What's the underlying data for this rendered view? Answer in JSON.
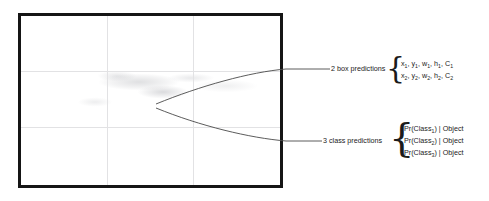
{
  "figure": {
    "image_panel": {
      "name": "input-image-with-grid",
      "grid_columns": 3,
      "grid_rows": 3,
      "border_color": "#151515",
      "grid_color": "#e2e2e4"
    },
    "annotations": [
      {
        "id": "box-predictions",
        "label": "2 box predictions",
        "rows": [
          {
            "parts": [
              {
                "t": "x",
                "sub": "1"
              },
              {
                "t": ", "
              },
              {
                "t": "y",
                "sub": "1"
              },
              {
                "t": ", "
              },
              {
                "t": "w",
                "sub": "1"
              },
              {
                "t": ", "
              },
              {
                "t": "h",
                "sub": "1"
              },
              {
                "t": ", "
              },
              {
                "t": "C",
                "sub": "1"
              }
            ],
            "plain": "x1, y1, w1, h1, C1"
          },
          {
            "parts": [
              {
                "t": "x",
                "sub": "2"
              },
              {
                "t": ", "
              },
              {
                "t": "y",
                "sub": "2"
              },
              {
                "t": ", "
              },
              {
                "t": "w",
                "sub": "2"
              },
              {
                "t": ", "
              },
              {
                "t": "h",
                "sub": "2"
              },
              {
                "t": ", "
              },
              {
                "t": "C",
                "sub": "2"
              }
            ],
            "plain": "x2, y2, w2, h2, C2"
          }
        ],
        "brace": "{"
      },
      {
        "id": "class-predictions",
        "label": "3 class predictions",
        "rows": [
          {
            "parts": [
              {
                "t": "Pr(Class"
              },
              {
                "t": "1",
                "sub": true
              },
              {
                "t": ") | Object"
              }
            ],
            "plain": "Pr(Class1) | Object"
          },
          {
            "parts": [
              {
                "t": "Pr(Class"
              },
              {
                "t": "2",
                "sub": true
              },
              {
                "t": ") | Object"
              }
            ],
            "plain": "Pr(Class2) | Object"
          },
          {
            "parts": [
              {
                "t": "Pr(Class"
              },
              {
                "t": "3",
                "sub": true
              },
              {
                "t": ") | Object"
              }
            ],
            "plain": "Pr(Class3) | Object"
          }
        ],
        "brace": "{"
      }
    ],
    "box_predictions": {
      "label": "2 box predictions",
      "brace": "{",
      "line1": {
        "pre": "x",
        "s1": "1",
        "a": ", y",
        "s2": "1",
        "b": ", w",
        "s3": "1",
        "c": ", h",
        "s4": "1",
        "d": ", C",
        "s5": "1"
      },
      "line2": {
        "pre": "x",
        "s1": "2",
        "a": ", y",
        "s2": "2",
        "b": ", w",
        "s3": "2",
        "c": ", h",
        "s4": "2",
        "d": ", C",
        "s5": "2"
      }
    },
    "class_predictions": {
      "label": "3 class predictions",
      "brace": "{",
      "line1_pre": "Pr(Class",
      "line1_sub": "1",
      "line1_post": ") | Object",
      "line2_pre": "Pr(Class",
      "line2_sub": "2",
      "line2_post": ") | Object",
      "line3_pre": "Pr(Class",
      "line3_sub": "3",
      "line3_post": ") | Object"
    }
  }
}
